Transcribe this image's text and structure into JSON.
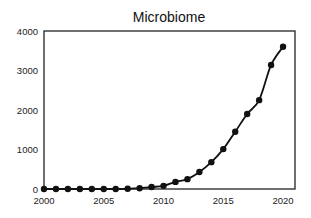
{
  "chart_data": {
    "type": "line",
    "title": "Microbiome",
    "xlabel": "",
    "ylabel": "",
    "x": [
      2000,
      2001,
      2002,
      2003,
      2004,
      2005,
      2006,
      2007,
      2008,
      2009,
      2010,
      2011,
      2012,
      2013,
      2014,
      2015,
      2016,
      2017,
      2018,
      2019,
      2020
    ],
    "series": [
      {
        "name": "Microbiome",
        "values": [
          0,
          0,
          0,
          0,
          0,
          0,
          0,
          5,
          20,
          50,
          80,
          180,
          250,
          430,
          680,
          1010,
          1450,
          1900,
          2250,
          3140,
          3600
        ]
      }
    ],
    "xlim": [
      2000,
      2021
    ],
    "ylim": [
      0,
      4000
    ],
    "x_ticks": [
      "2000",
      "2005",
      "2010",
      "2015",
      "2020"
    ],
    "y_ticks": [
      "0",
      "1000",
      "2000",
      "3000",
      "4000"
    ],
    "grid": false,
    "legend": "none",
    "markers": "filled-circle",
    "line_style": "smoothed"
  }
}
